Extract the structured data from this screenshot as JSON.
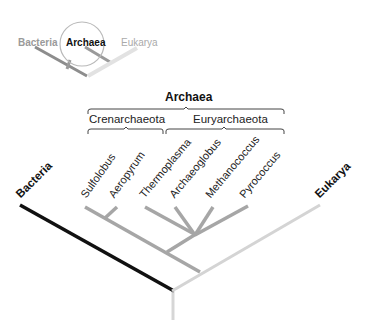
{
  "inset": {
    "labels": {
      "bacteria": "Bacteria",
      "archaea": "Archaea",
      "eukarya": "Eukarya"
    },
    "highlighted": "Archaea"
  },
  "tree": {
    "domain_labels": {
      "bacteria": "Bacteria",
      "eukarya": "Eukarya"
    },
    "clade_labels": {
      "archaea": "Archaea",
      "crenarchaeota": "Crenarchaeota",
      "euryarchaeota": "Euryarchaeota"
    },
    "taxa": [
      "Sulfolobus",
      "Aeropyrum",
      "Thermoplasma",
      "Archaeoglobus",
      "Methanococcus",
      "Pyrococcus"
    ]
  },
  "colors": {
    "bacteria_branch": "#111111",
    "archaea_branch": "#a6a6a6",
    "eukarya_branch": "#d4d4d4",
    "inset_gray": "#9a9a9a",
    "inset_light": "#cfcfcf"
  }
}
